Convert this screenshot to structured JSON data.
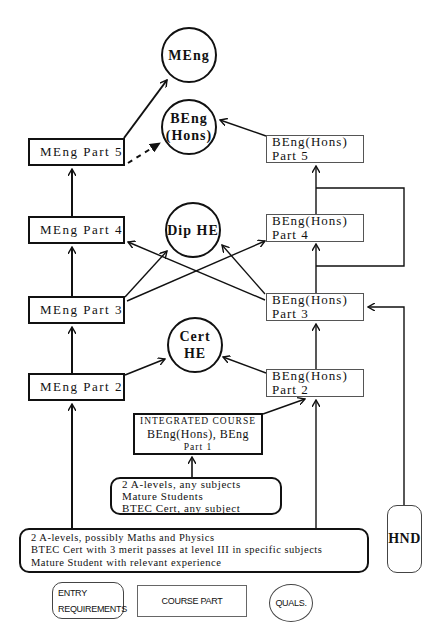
{
  "qualifications": {
    "meng": "MEng",
    "beng_hons_line1": "BEng",
    "beng_hons_line2": "(Hons)",
    "dip_he": "Dip HE",
    "cert_he_line1": "Cert",
    "cert_he_line2": "HE"
  },
  "meng_course": {
    "part5": "MEng Part 5",
    "part4": "MEng Part 4",
    "part3": "MEng Part 3",
    "part2": "MEng Part 2"
  },
  "beng_course": {
    "part5": {
      "line1": "BEng(Hons)",
      "line2": "Part 5"
    },
    "part4": {
      "line1": "BEng(Hons)",
      "line2": "Part 4"
    },
    "part3": {
      "line1": "BEng(Hons)",
      "line2": "Part 3"
    },
    "part2": {
      "line1": "BEng(Hons)",
      "line2": "Part 2"
    }
  },
  "integrated_course": {
    "line1": "INTEGRATED COURSE",
    "line2": "BEng(Hons), BEng",
    "line3": "Part 1"
  },
  "entry_requirements": {
    "foundation": [
      "2  A-levels, any subjects",
      "Mature Students",
      "BTEC Cert, any subject"
    ],
    "direct": [
      "2 A-levels, possibly Maths and Physics",
      "BTEC Cert with 3 merit passes at level III in specific subjects",
      "Mature Student with relevant experience"
    ],
    "hnd": "HND"
  },
  "legend": {
    "entry_line1": "ENTRY",
    "entry_line2": "REQUIREMENTS",
    "course_part": "COURSE PART",
    "quals": "QUALS."
  },
  "edges": [
    {
      "from": "MEng Part 2",
      "to": "MEng Part 3"
    },
    {
      "from": "MEng Part 3",
      "to": "MEng Part 4"
    },
    {
      "from": "MEng Part 4",
      "to": "MEng Part 5"
    },
    {
      "from": "MEng Part 5",
      "to": "MEng"
    },
    {
      "from": "MEng Part 5",
      "to": "BEng (Hons)",
      "style": "dashed"
    },
    {
      "from": "MEng Part 2",
      "to": "Cert HE"
    },
    {
      "from": "MEng Part 3",
      "to": "Dip HE"
    },
    {
      "from": "MEng Part 3",
      "to": "BEng(Hons) Part 4"
    },
    {
      "from": "BEng(Hons) Part 3",
      "to": "MEng Part 4"
    },
    {
      "from": "BEng(Hons) Part 3",
      "to": "Dip HE"
    },
    {
      "from": "BEng(Hons) Part 2",
      "to": "Cert HE"
    },
    {
      "from": "BEng(Hons) Part 2",
      "to": "BEng(Hons) Part 3"
    },
    {
      "from": "BEng(Hons) Part 3",
      "to": "BEng(Hons) Part 4"
    },
    {
      "from": "BEng(Hons) Part 4",
      "to": "BEng(Hons) Part 5"
    },
    {
      "from": "BEng(Hons) Part 3",
      "to": "BEng(Hons) Part 5",
      "style": "bypass"
    },
    {
      "from": "BEng(Hons) Part 5",
      "to": "BEng (Hons)"
    },
    {
      "from": "Integrated Part 1",
      "to": "BEng(Hons) Part 2"
    },
    {
      "from": "Entry (any subjects)",
      "to": "Integrated Part 1"
    },
    {
      "from": "Entry (Maths/Physics)",
      "to": "MEng Part 2"
    },
    {
      "from": "Entry (Maths/Physics)",
      "to": "BEng(Hons) Part 2"
    },
    {
      "from": "HND",
      "to": "BEng(Hons) Part 3"
    }
  ]
}
